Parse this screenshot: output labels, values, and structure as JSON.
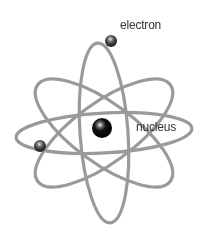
{
  "diagram": {
    "labels": {
      "electron": "electron",
      "nucleus": "nucleus"
    },
    "colors": {
      "background": "#ffffff",
      "orbit": "#9a9a9a",
      "nucleus": "#0a0a0a",
      "electron": "#3a3a3a",
      "label": "#333333"
    },
    "nucleus": {
      "cx": 102,
      "cy": 128,
      "r": 10
    },
    "electrons": [
      {
        "name": "top-electron",
        "cx": 111,
        "cy": 41,
        "r": 6
      },
      {
        "name": "left-electron",
        "cx": 40,
        "cy": 146,
        "r": 6
      }
    ],
    "orbits": [
      {
        "name": "vertical-orbit",
        "cx": 104,
        "cy": 133,
        "rx": 24,
        "ry": 90,
        "rotate": -4
      },
      {
        "name": "horizontal-orbit",
        "cx": 104,
        "cy": 133,
        "rx": 88,
        "ry": 20,
        "rotate": -3
      },
      {
        "name": "diagonal-orbit-left",
        "cx": 104,
        "cy": 133,
        "rx": 82,
        "ry": 30,
        "rotate": 36
      },
      {
        "name": "diagonal-orbit-right",
        "cx": 104,
        "cy": 133,
        "rx": 82,
        "ry": 30,
        "rotate": -36
      }
    ]
  }
}
